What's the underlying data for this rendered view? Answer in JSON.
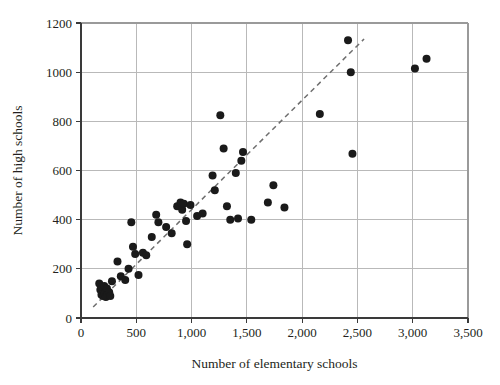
{
  "chart_data": {
    "type": "scatter",
    "title": "",
    "xlabel": "Number of elementary schools",
    "ylabel": "Number of high schools",
    "xlim": [
      0,
      3500
    ],
    "ylim": [
      0,
      1200
    ],
    "xticks": [
      0,
      500,
      1000,
      1500,
      2000,
      2500,
      3000,
      3500
    ],
    "xtick_labels": [
      "0",
      "500",
      "1,000",
      "1,500",
      "2,000",
      "2,500",
      "3,000",
      "3,500"
    ],
    "yticks": [
      0,
      200,
      400,
      600,
      800,
      1000,
      1200
    ],
    "ytick_labels": [
      "0",
      "200",
      "400",
      "600",
      "800",
      "1000",
      "1200"
    ],
    "grid": true,
    "legend": "none",
    "point_color": "#1a1a1a",
    "point_radius": 4,
    "series": [
      {
        "name": "States",
        "points": [
          [
            165,
            140
          ],
          [
            175,
            115
          ],
          [
            185,
            95
          ],
          [
            200,
            90
          ],
          [
            210,
            130
          ],
          [
            215,
            100
          ],
          [
            225,
            85
          ],
          [
            235,
            120
          ],
          [
            240,
            95
          ],
          [
            255,
            105
          ],
          [
            265,
            90
          ],
          [
            280,
            150
          ],
          [
            330,
            230
          ],
          [
            360,
            170
          ],
          [
            400,
            155
          ],
          [
            430,
            200
          ],
          [
            455,
            390
          ],
          [
            470,
            290
          ],
          [
            490,
            260
          ],
          [
            520,
            175
          ],
          [
            560,
            265
          ],
          [
            590,
            255
          ],
          [
            640,
            330
          ],
          [
            680,
            420
          ],
          [
            700,
            390
          ],
          [
            770,
            370
          ],
          [
            820,
            345
          ],
          [
            870,
            455
          ],
          [
            900,
            470
          ],
          [
            915,
            440
          ],
          [
            930,
            465
          ],
          [
            950,
            395
          ],
          [
            960,
            300
          ],
          [
            990,
            460
          ],
          [
            1050,
            415
          ],
          [
            1100,
            425
          ],
          [
            1190,
            580
          ],
          [
            1210,
            520
          ],
          [
            1260,
            825
          ],
          [
            1290,
            690
          ],
          [
            1320,
            455
          ],
          [
            1350,
            400
          ],
          [
            1400,
            590
          ],
          [
            1420,
            405
          ],
          [
            1450,
            640
          ],
          [
            1465,
            675
          ],
          [
            1540,
            400
          ],
          [
            1690,
            470
          ],
          [
            1740,
            540
          ],
          [
            1840,
            450
          ],
          [
            2160,
            830
          ],
          [
            2415,
            1130
          ],
          [
            2440,
            1000
          ],
          [
            2455,
            668
          ],
          [
            3020,
            1015
          ],
          [
            3125,
            1055
          ]
        ]
      }
    ],
    "trend_line": {
      "style": "dashed",
      "color": "#6e6e6e",
      "x_start": 110,
      "y_start": 45,
      "x_end": 2560,
      "y_end": 1135
    }
  }
}
